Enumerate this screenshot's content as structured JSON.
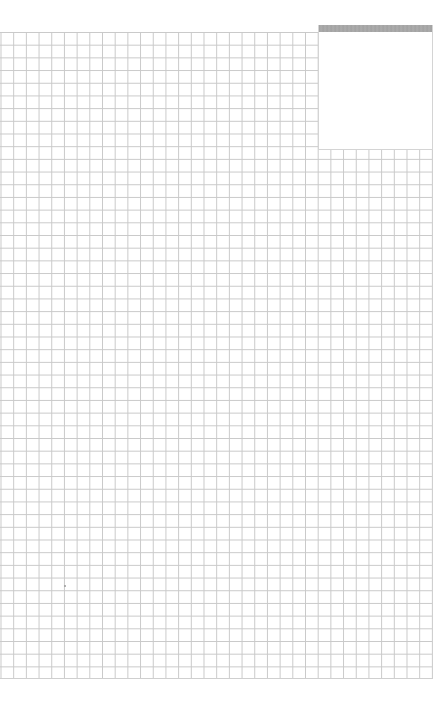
{
  "page": {
    "type": "grid-paper",
    "background_color": "#ffffff"
  },
  "grid": {
    "line_color": "#c9c9c9",
    "cell_size_px": 12.7,
    "columns": 34,
    "rows": 51
  },
  "overlay_panel": {
    "header_color": "#a6a6a6",
    "body_color": "#ffffff"
  }
}
